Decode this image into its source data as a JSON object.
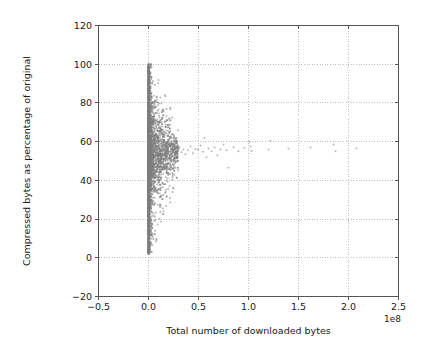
{
  "chart_data": {
    "type": "scatter",
    "title": "",
    "xlabel": "Total number of downloaded bytes",
    "ylabel": "Compressed bytes as percentage of original",
    "x_offset_text": "1e8",
    "xlim": [
      -0.5,
      2.5
    ],
    "ylim": [
      -20,
      120
    ],
    "xticks": [
      -0.5,
      0.0,
      0.5,
      1.0,
      1.5,
      2.0,
      2.5
    ],
    "xticklabels": [
      "−0.5",
      "0.0",
      "0.5",
      "1.0",
      "1.5",
      "2.0",
      "2.5"
    ],
    "yticks": [
      -20,
      0,
      20,
      40,
      60,
      80,
      100,
      120
    ],
    "yticklabels": [
      "−20",
      "0",
      "20",
      "40",
      "60",
      "80",
      "100",
      "120"
    ],
    "grid": true,
    "grid_style": "dotted",
    "grid_color": "#b0b0b0",
    "legend": null,
    "marker": {
      "shape": "circle",
      "color": "#808080",
      "size": 2,
      "alpha": 0.55
    },
    "axes_frame_color": "#555555",
    "background_color": "#ffffff",
    "series": [
      {
        "name": "downloads",
        "x_units": "1e8 bytes",
        "y_units": "percent",
        "points": [
          [
            0.001,
            99.8
          ],
          [
            0.002,
            99.2
          ],
          [
            0.001,
            98.4
          ],
          [
            0.003,
            97.6
          ],
          [
            0.002,
            96.8
          ],
          [
            0.004,
            96.0
          ],
          [
            0.001,
            95.2
          ],
          [
            0.002,
            94.4
          ],
          [
            0.005,
            93.6
          ],
          [
            0.003,
            92.8
          ],
          [
            0.002,
            92.0
          ],
          [
            0.001,
            91.2
          ],
          [
            0.004,
            90.4
          ],
          [
            0.002,
            89.6
          ],
          [
            0.003,
            88.8
          ],
          [
            0.001,
            88.0
          ],
          [
            0.005,
            87.2
          ],
          [
            0.002,
            86.4
          ],
          [
            0.003,
            85.6
          ],
          [
            0.001,
            84.8
          ],
          [
            0.004,
            84.0
          ],
          [
            0.002,
            83.2
          ],
          [
            0.006,
            82.4
          ],
          [
            0.003,
            81.6
          ],
          [
            0.001,
            80.8
          ],
          [
            0.002,
            80.0
          ],
          [
            0.004,
            79.2
          ],
          [
            0.003,
            78.4
          ],
          [
            0.001,
            77.6
          ],
          [
            0.005,
            76.8
          ],
          [
            0.002,
            76.0
          ],
          [
            0.003,
            75.2
          ],
          [
            0.007,
            74.4
          ],
          [
            0.001,
            73.6
          ],
          [
            0.004,
            72.8
          ],
          [
            0.002,
            72.0
          ],
          [
            0.003,
            71.2
          ],
          [
            0.001,
            70.4
          ],
          [
            0.006,
            69.6
          ],
          [
            0.002,
            68.8
          ],
          [
            0.004,
            68.0
          ],
          [
            0.003,
            67.2
          ],
          [
            0.001,
            66.4
          ],
          [
            0.008,
            65.6
          ],
          [
            0.002,
            64.8
          ],
          [
            0.005,
            64.0
          ],
          [
            0.003,
            63.2
          ],
          [
            0.001,
            62.4
          ],
          [
            0.004,
            61.6
          ],
          [
            0.002,
            60.8
          ],
          [
            0.006,
            60.0
          ],
          [
            0.003,
            59.2
          ],
          [
            0.001,
            58.4
          ],
          [
            0.009,
            57.6
          ],
          [
            0.002,
            56.8
          ],
          [
            0.004,
            56.0
          ],
          [
            0.003,
            55.2
          ],
          [
            0.001,
            54.4
          ],
          [
            0.007,
            53.6
          ],
          [
            0.002,
            52.8
          ],
          [
            0.005,
            52.0
          ],
          [
            0.003,
            51.2
          ],
          [
            0.001,
            50.4
          ],
          [
            0.004,
            49.6
          ],
          [
            0.002,
            48.8
          ],
          [
            0.006,
            48.0
          ],
          [
            0.003,
            47.2
          ],
          [
            0.001,
            46.4
          ],
          [
            0.005,
            45.6
          ],
          [
            0.002,
            44.8
          ],
          [
            0.004,
            44.0
          ],
          [
            0.003,
            43.2
          ],
          [
            0.001,
            42.4
          ],
          [
            0.007,
            41.6
          ],
          [
            0.002,
            40.8
          ],
          [
            0.003,
            40.0
          ],
          [
            0.001,
            39.2
          ],
          [
            0.004,
            38.4
          ],
          [
            0.002,
            37.6
          ],
          [
            0.005,
            36.8
          ],
          [
            0.003,
            36.0
          ],
          [
            0.001,
            35.2
          ],
          [
            0.002,
            34.4
          ],
          [
            0.004,
            33.6
          ],
          [
            0.003,
            32.8
          ],
          [
            0.001,
            32.0
          ],
          [
            0.002,
            31.2
          ],
          [
            0.005,
            30.4
          ],
          [
            0.003,
            29.6
          ],
          [
            0.001,
            28.8
          ],
          [
            0.002,
            28.0
          ],
          [
            0.004,
            27.2
          ],
          [
            0.003,
            26.4
          ],
          [
            0.001,
            25.6
          ],
          [
            0.002,
            24.8
          ],
          [
            0.003,
            24.0
          ],
          [
            0.001,
            23.2
          ],
          [
            0.004,
            22.4
          ],
          [
            0.002,
            21.6
          ],
          [
            0.003,
            20.8
          ],
          [
            0.001,
            20.0
          ],
          [
            0.002,
            19.2
          ],
          [
            0.003,
            18.4
          ],
          [
            0.001,
            17.6
          ],
          [
            0.002,
            16.8
          ],
          [
            0.004,
            16.0
          ],
          [
            0.001,
            15.2
          ],
          [
            0.003,
            14.4
          ],
          [
            0.002,
            13.6
          ],
          [
            0.001,
            12.8
          ],
          [
            0.002,
            12.0
          ],
          [
            0.003,
            11.2
          ],
          [
            0.001,
            10.4
          ],
          [
            0.002,
            9.6
          ],
          [
            0.001,
            8.8
          ],
          [
            0.003,
            8.0
          ],
          [
            0.002,
            7.2
          ],
          [
            0.001,
            6.4
          ],
          [
            0.002,
            5.6
          ],
          [
            0.001,
            4.8
          ],
          [
            0.002,
            4.0
          ],
          [
            0.001,
            3.2
          ],
          [
            0.001,
            2.4
          ],
          [
            0.002,
            2.0
          ],
          [
            0.015,
            95.0
          ],
          [
            0.025,
            93.0
          ],
          [
            0.022,
            88.5
          ],
          [
            0.018,
            86.0
          ],
          [
            0.03,
            83.0
          ],
          [
            0.012,
            82.0
          ],
          [
            0.035,
            80.5
          ],
          [
            0.04,
            80.0
          ],
          [
            0.095,
            80.2
          ],
          [
            0.13,
            79.8
          ],
          [
            0.02,
            78.0
          ],
          [
            0.028,
            76.5
          ],
          [
            0.045,
            75.0
          ],
          [
            0.016,
            74.0
          ],
          [
            0.055,
            73.0
          ],
          [
            0.032,
            72.0
          ],
          [
            0.07,
            71.0
          ],
          [
            0.024,
            70.0
          ],
          [
            0.048,
            69.0
          ],
          [
            0.085,
            68.5
          ],
          [
            0.038,
            67.5
          ],
          [
            0.019,
            66.5
          ],
          [
            0.06,
            66.0
          ],
          [
            0.105,
            65.5
          ],
          [
            0.027,
            65.0
          ],
          [
            0.05,
            64.5
          ],
          [
            0.075,
            64.0
          ],
          [
            0.033,
            63.5
          ],
          [
            0.12,
            63.0
          ],
          [
            0.042,
            62.5
          ],
          [
            0.065,
            62.0
          ],
          [
            0.021,
            61.5
          ],
          [
            0.09,
            61.0
          ],
          [
            0.036,
            60.5
          ],
          [
            0.145,
            60.0
          ],
          [
            0.058,
            60.0
          ],
          [
            0.1,
            59.5
          ],
          [
            0.029,
            59.0
          ],
          [
            0.18,
            59.0
          ],
          [
            0.047,
            58.5
          ],
          [
            0.078,
            58.0
          ],
          [
            0.023,
            58.0
          ],
          [
            0.21,
            57.8
          ],
          [
            0.134,
            57.5
          ],
          [
            0.052,
            57.2
          ],
          [
            0.088,
            57.0
          ],
          [
            0.031,
            56.8
          ],
          [
            0.165,
            56.5
          ],
          [
            0.062,
            56.2
          ],
          [
            0.245,
            56.0
          ],
          [
            0.11,
            56.0
          ],
          [
            0.041,
            55.8
          ],
          [
            0.072,
            55.5
          ],
          [
            0.026,
            55.2
          ],
          [
            0.195,
            55.0
          ],
          [
            0.14,
            55.0
          ],
          [
            0.056,
            54.8
          ],
          [
            0.082,
            54.5
          ],
          [
            0.034,
            54.2
          ],
          [
            0.225,
            54.0
          ],
          [
            0.115,
            54.0
          ],
          [
            0.044,
            53.8
          ],
          [
            0.068,
            53.5
          ],
          [
            0.022,
            53.2
          ],
          [
            0.155,
            53.0
          ],
          [
            0.096,
            53.0
          ],
          [
            0.037,
            52.8
          ],
          [
            0.175,
            52.5
          ],
          [
            0.049,
            52.2
          ],
          [
            0.125,
            52.0
          ],
          [
            0.064,
            52.0
          ],
          [
            0.028,
            51.8
          ],
          [
            0.205,
            51.5
          ],
          [
            0.084,
            51.2
          ],
          [
            0.043,
            51.0
          ],
          [
            0.15,
            51.0
          ],
          [
            0.07,
            50.8
          ],
          [
            0.03,
            50.5
          ],
          [
            0.19,
            50.2
          ],
          [
            0.102,
            50.0
          ],
          [
            0.054,
            50.0
          ],
          [
            0.025,
            49.5
          ],
          [
            0.135,
            49.0
          ],
          [
            0.076,
            48.8
          ],
          [
            0.039,
            48.5
          ],
          [
            0.16,
            48.0
          ],
          [
            0.092,
            47.8
          ],
          [
            0.046,
            47.5
          ],
          [
            0.118,
            47.0
          ],
          [
            0.066,
            46.8
          ],
          [
            0.032,
            46.5
          ],
          [
            0.142,
            46.0
          ],
          [
            0.08,
            45.5
          ],
          [
            0.051,
            45.0
          ],
          [
            0.106,
            44.5
          ],
          [
            0.06,
            44.0
          ],
          [
            0.035,
            43.5
          ],
          [
            0.128,
            43.0
          ],
          [
            0.073,
            42.5
          ],
          [
            0.042,
            42.0
          ],
          [
            0.098,
            41.5
          ],
          [
            0.057,
            41.0
          ],
          [
            0.029,
            40.5
          ],
          [
            0.112,
            40.0
          ],
          [
            0.067,
            39.5
          ],
          [
            0.038,
            39.0
          ],
          [
            0.086,
            38.0
          ],
          [
            0.048,
            37.5
          ],
          [
            0.026,
            37.0
          ],
          [
            0.074,
            36.0
          ],
          [
            0.04,
            35.5
          ],
          [
            0.022,
            35.0
          ],
          [
            0.058,
            34.0
          ],
          [
            0.033,
            33.0
          ],
          [
            0.018,
            32.0
          ],
          [
            0.045,
            31.0
          ],
          [
            0.027,
            30.0
          ],
          [
            0.015,
            29.0
          ],
          [
            0.036,
            28.0
          ],
          [
            0.02,
            26.5
          ],
          [
            0.012,
            25.0
          ],
          [
            0.028,
            24.0
          ],
          [
            0.016,
            22.5
          ],
          [
            0.01,
            21.0
          ],
          [
            0.022,
            20.0
          ],
          [
            0.013,
            18.0
          ],
          [
            0.008,
            16.0
          ],
          [
            0.017,
            14.0
          ],
          [
            0.009,
            12.0
          ],
          [
            0.011,
            10.0
          ],
          [
            0.007,
            8.0
          ],
          [
            0.006,
            6.0
          ],
          [
            0.005,
            4.5
          ],
          [
            0.004,
            3.0
          ],
          [
            0.255,
            58.5
          ],
          [
            0.27,
            56.5
          ],
          [
            0.29,
            55.0
          ],
          [
            0.31,
            57.0
          ],
          [
            0.33,
            54.5
          ],
          [
            0.35,
            56.0
          ],
          [
            0.37,
            53.5
          ],
          [
            0.395,
            55.5
          ],
          [
            0.42,
            57.5
          ],
          [
            0.445,
            54.0
          ],
          [
            0.47,
            56.2
          ],
          [
            0.495,
            55.8
          ],
          [
            0.52,
            58.0
          ],
          [
            0.545,
            54.8
          ],
          [
            0.56,
            62.0
          ],
          [
            0.58,
            52.0
          ],
          [
            0.6,
            56.5
          ],
          [
            0.63,
            55.0
          ],
          [
            0.66,
            57.0
          ],
          [
            0.69,
            53.0
          ],
          [
            0.72,
            56.0
          ],
          [
            0.75,
            58.5
          ],
          [
            0.78,
            55.5
          ],
          [
            0.8,
            46.5
          ],
          [
            0.85,
            57.2
          ],
          [
            0.9,
            55.0
          ],
          [
            0.96,
            56.8
          ],
          [
            1.01,
            60.0
          ],
          [
            1.02,
            57.5
          ],
          [
            1.03,
            55.2
          ],
          [
            1.2,
            56.0
          ],
          [
            1.22,
            60.5
          ],
          [
            1.4,
            56.5
          ],
          [
            1.62,
            57.0
          ],
          [
            1.85,
            58.5
          ],
          [
            1.87,
            55.0
          ],
          [
            2.08,
            56.5
          ]
        ]
      }
    ]
  }
}
